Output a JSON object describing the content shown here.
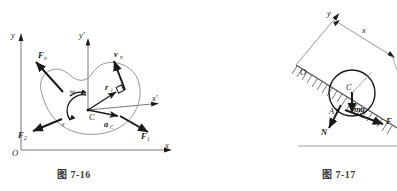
{
  "page": {
    "width": 397,
    "height": 191,
    "background": "#ffffff",
    "ink": "#1a1a1a",
    "caption_color": "#3a3a3a"
  },
  "figures": [
    {
      "id": "fig-7-16",
      "caption": "图 7-16",
      "description": "Planar rigid body in xOy frame with translating frame x'y' at mass center C, showing angular velocity, angular acceleration, mass-center acceleration and applied forces.",
      "axes": {
        "global_origin": "O",
        "global_x": "x",
        "global_y": "y",
        "local_x": "x'",
        "local_y": "y'"
      },
      "labels": {
        "mass_center": "C",
        "omega": "ω",
        "epsilon": "ε",
        "radius_vector": "r",
        "radius_vector_sub": "i",
        "accel_center": "a",
        "accel_center_sub": "C",
        "velocity": "v",
        "velocity_sub": "n",
        "force_n": "F",
        "force_n_sub": "n",
        "force_1": "F",
        "force_1_sub": "1",
        "force_2": "F",
        "force_2_sub": "2"
      }
    },
    {
      "id": "fig-7-17",
      "caption": "图 7-17",
      "description": "Disc rolling on an inclined hatched surface with inclined xOy frame; contact point A carries normal force N and friction force F, weight mg acts at center C.",
      "axes": {
        "origin": "O",
        "x": "x",
        "y": "y"
      },
      "labels": {
        "center": "C",
        "contact_point": "A",
        "weight": "mg",
        "normal_force": "N",
        "friction_force": "F"
      }
    }
  ]
}
